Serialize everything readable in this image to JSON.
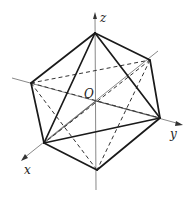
{
  "figure": {
    "type": "octahedron-3d",
    "labels": {
      "z_axis": "z",
      "y_axis": "y",
      "x_axis": "x",
      "origin": "O"
    },
    "vertices": {
      "top": [
        95,
        33
      ],
      "bottom": [
        97,
        170
      ],
      "left_back": [
        31,
        83
      ],
      "right_back": [
        150,
        60
      ],
      "right_front": [
        160,
        118
      ],
      "left_front": [
        44,
        143
      ],
      "origin": [
        96,
        101
      ]
    },
    "colors": {
      "edge": "#1a1a1a",
      "axis": "#7a7a7a",
      "background": "#ffffff"
    }
  }
}
